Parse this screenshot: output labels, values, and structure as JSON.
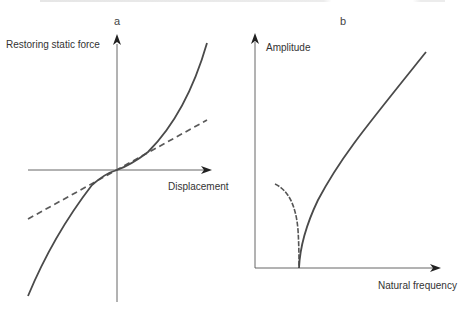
{
  "figure": {
    "panels": [
      {
        "id": "a",
        "label": "a",
        "y_axis_label": "Restoring static force",
        "x_axis_label": "Displacement",
        "curves": [
          {
            "name": "nonlinear-stiffening-force",
            "style": "solid",
            "description": "cubic hardening restoring force"
          },
          {
            "name": "linear-force",
            "style": "dashed",
            "description": "linear restoring force"
          }
        ]
      },
      {
        "id": "b",
        "label": "b",
        "y_axis_label": "Amplitude",
        "x_axis_label": "Natural frequency",
        "curves": [
          {
            "name": "hardening-branch",
            "style": "solid",
            "description": "amplitude rising with natural frequency"
          },
          {
            "name": "softening-branch",
            "style": "dashed",
            "description": "amplitude falling to zero at linear natural frequency"
          }
        ]
      }
    ]
  },
  "colors": {
    "curve": "#4a4a4a",
    "axis": "#555555",
    "text": "#333333"
  }
}
